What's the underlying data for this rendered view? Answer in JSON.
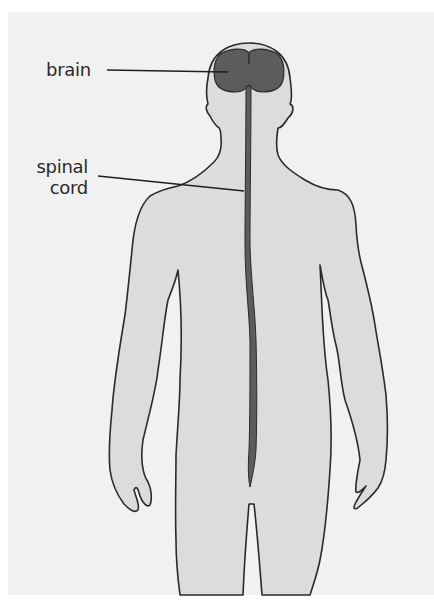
{
  "diagram": {
    "labels": {
      "brain": "brain",
      "spinal_line1": "spinal",
      "spinal_line2": "cord"
    },
    "parts": [
      "body-silhouette",
      "brain",
      "spinal-cord"
    ]
  },
  "colors": {
    "background": "#f1f1f1",
    "body_fill": "#dcdcdc",
    "outline": "#2a2a2a",
    "brain_fill": "#5c5c5c",
    "spinal_cord_fill": "#5c5c5c",
    "leader_line": "#1e1e1e"
  }
}
